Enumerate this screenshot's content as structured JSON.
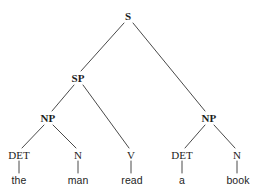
{
  "figure": {
    "kind": "constituency-syntax-tree",
    "sentence": "the man read a book",
    "background_color": "#ffffff",
    "edge_color": "#4a4a4a",
    "text_color": "#1d1d1d"
  },
  "nodes": [
    {
      "id": "s",
      "label": "S",
      "type": "phrase",
      "x": 128,
      "y": 16
    },
    {
      "id": "sp",
      "label": "SP",
      "type": "phrase",
      "x": 78,
      "y": 78
    },
    {
      "id": "np_subj",
      "label": "NP",
      "type": "phrase",
      "x": 48,
      "y": 118
    },
    {
      "id": "np_obj",
      "label": "NP",
      "type": "phrase",
      "x": 209,
      "y": 118
    },
    {
      "id": "det1",
      "label": "DET",
      "type": "pos",
      "x": 19,
      "y": 155
    },
    {
      "id": "n1",
      "label": "N",
      "type": "pos",
      "x": 78,
      "y": 155
    },
    {
      "id": "v1",
      "label": "V",
      "type": "pos",
      "x": 131,
      "y": 155
    },
    {
      "id": "det2",
      "label": "DET",
      "type": "pos",
      "x": 182,
      "y": 155
    },
    {
      "id": "n2",
      "label": "N",
      "type": "pos",
      "x": 237,
      "y": 155
    },
    {
      "id": "w_the",
      "label": "the",
      "type": "word",
      "x": 19,
      "y": 180
    },
    {
      "id": "w_man",
      "label": "man",
      "type": "word",
      "x": 78,
      "y": 180
    },
    {
      "id": "w_read",
      "label": "read",
      "type": "word",
      "x": 132,
      "y": 180
    },
    {
      "id": "w_a",
      "label": "a",
      "type": "word",
      "x": 182,
      "y": 180
    },
    {
      "id": "w_book",
      "label": "book",
      "type": "word",
      "x": 238,
      "y": 180
    }
  ],
  "edges": [
    {
      "from": "s",
      "to": "sp",
      "x1": 124,
      "y1": 23,
      "x2": 81,
      "y2": 71
    },
    {
      "from": "s",
      "to": "np_obj",
      "x1": 133,
      "y1": 23,
      "x2": 205,
      "y2": 111
    },
    {
      "from": "sp",
      "to": "np_subj",
      "x1": 74,
      "y1": 85,
      "x2": 52,
      "y2": 111
    },
    {
      "from": "sp",
      "to": "v1",
      "x1": 83,
      "y1": 85,
      "x2": 129,
      "y2": 148
    },
    {
      "from": "np_subj",
      "to": "det1",
      "x1": 44,
      "y1": 125,
      "x2": 22,
      "y2": 148
    },
    {
      "from": "np_subj",
      "to": "n1",
      "x1": 53,
      "y1": 125,
      "x2": 76,
      "y2": 148
    },
    {
      "from": "np_obj",
      "to": "det2",
      "x1": 205,
      "y1": 125,
      "x2": 185,
      "y2": 148
    },
    {
      "from": "np_obj",
      "to": "n2",
      "x1": 214,
      "y1": 125,
      "x2": 235,
      "y2": 148
    },
    {
      "from": "det1",
      "to": "w_the",
      "x1": 19,
      "y1": 161,
      "x2": 19,
      "y2": 173
    },
    {
      "from": "n1",
      "to": "w_man",
      "x1": 78,
      "y1": 161,
      "x2": 78,
      "y2": 173
    },
    {
      "from": "v1",
      "to": "w_read",
      "x1": 131,
      "y1": 161,
      "x2": 131,
      "y2": 173
    },
    {
      "from": "det2",
      "to": "w_a",
      "x1": 182,
      "y1": 161,
      "x2": 182,
      "y2": 173
    },
    {
      "from": "n2",
      "to": "w_book",
      "x1": 237,
      "y1": 161,
      "x2": 237,
      "y2": 173
    }
  ]
}
